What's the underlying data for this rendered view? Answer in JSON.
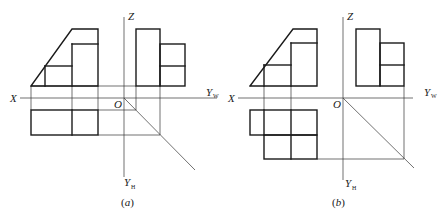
{
  "figure": {
    "panels": [
      {
        "id": "a",
        "caption_open": "(",
        "caption_letter": "a",
        "caption_close": ")",
        "axes": {
          "x_label": "X",
          "z_label": "Z",
          "o_label": "O",
          "yw_label": "Y",
          "yw_sub": "W",
          "yh_label": "Y",
          "yh_sub": "H"
        }
      },
      {
        "id": "b",
        "caption_open": "(",
        "caption_letter": "b",
        "caption_close": ")",
        "axes": {
          "x_label": "X",
          "z_label": "Z",
          "o_label": "O",
          "yw_label": "Y",
          "yw_sub": "W",
          "yh_label": "Y",
          "yh_sub": "H"
        }
      }
    ],
    "colors": {
      "line": "#1a1a1a",
      "background": "#ffffff"
    }
  }
}
